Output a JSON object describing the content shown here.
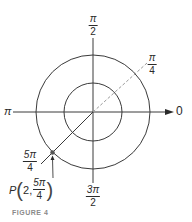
{
  "figure": {
    "caption": "FIGURE 4",
    "colors": {
      "stroke": "#3a3a3a",
      "dashed": "#9a9a9a",
      "caption": "#8a8a8a",
      "point": "#555555"
    },
    "labels": {
      "angle_0": "0",
      "angle_pi": "π",
      "angle_pi_over_2": {
        "num": "π",
        "den": "2"
      },
      "angle_pi_over_4": {
        "num": "π",
        "den": "4"
      },
      "angle_5pi_over_4": {
        "num": "5π",
        "den": "4"
      },
      "angle_3pi_over_2": {
        "num": "3π",
        "den": "2"
      },
      "point": {
        "name": "P",
        "r": "2,",
        "theta_num": "5π",
        "theta_den": "4",
        "open": "(",
        "close": ")"
      }
    },
    "geometry": {
      "center": [
        93,
        112
      ],
      "inner_radius": 29,
      "outer_radius": 57,
      "point_polar": {
        "r": 2,
        "theta": "5π/4"
      }
    }
  }
}
